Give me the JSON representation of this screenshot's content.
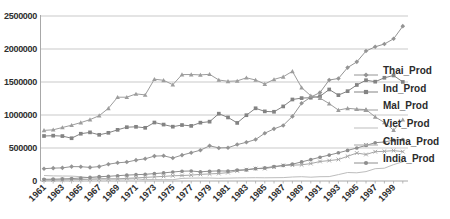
{
  "colors": {
    "background": "#ffffff",
    "gridline": "#c9c9c9",
    "axis": "#a8a8a8",
    "tick_text": "#2e2e2e",
    "legend_text": "#2b2b2b"
  },
  "chart_data": {
    "type": "line",
    "title": "",
    "xlabel": "",
    "ylabel": "",
    "grid": "horizontal",
    "legend_position": "right",
    "ylim": [
      0,
      2500000
    ],
    "y_ticks": [
      0,
      500000,
      1000000,
      1500000,
      2000000,
      2500000
    ],
    "y_tick_labels": [
      "0",
      "500000",
      "1000000",
      "1500000",
      "2000000",
      "2500000"
    ],
    "x": [
      1961,
      1962,
      1963,
      1964,
      1965,
      1966,
      1967,
      1968,
      1969,
      1970,
      1971,
      1972,
      1973,
      1974,
      1975,
      1976,
      1977,
      1978,
      1979,
      1980,
      1981,
      1982,
      1983,
      1984,
      1985,
      1986,
      1987,
      1988,
      1989,
      1990,
      1991,
      1992,
      1993,
      1994,
      1995,
      1996,
      1997,
      1998,
      1999,
      2000
    ],
    "x_tick_labels": [
      "1961",
      "1963",
      "1965",
      "1967",
      "1969",
      "1971",
      "1973",
      "1975",
      "1977",
      "1979",
      "1981",
      "1983",
      "1985",
      "1987",
      "1989",
      "1991",
      "1993",
      "1995",
      "1997",
      "1999"
    ],
    "series": [
      {
        "name": "Thai_Prod",
        "marker": "diamond",
        "color": "#949494",
        "values": [
          186000,
          195000,
          199000,
          218000,
          216000,
          206000,
          218000,
          254000,
          276000,
          287000,
          316000,
          336000,
          377000,
          382000,
          349000,
          392000,
          429000,
          467000,
          534000,
          501000,
          504000,
          552000,
          587000,
          629000,
          724000,
          790000,
          842000,
          979000,
          1178000,
          1271000,
          1341000,
          1531000,
          1553000,
          1718000,
          1805000,
          1970000,
          2033000,
          2076000,
          2155000,
          2346000
        ]
      },
      {
        "name": "Ind_Prod",
        "marker": "square",
        "color": "#838383",
        "values": [
          682000,
          687000,
          681000,
          648000,
          716000,
          737000,
          700000,
          730000,
          775000,
          815000,
          821000,
          806000,
          886000,
          855000,
          823000,
          848000,
          835000,
          884000,
          899000,
          1020000,
          963000,
          880000,
          997000,
          1102000,
          1055000,
          1049000,
          1130000,
          1235000,
          1256000,
          1262000,
          1284000,
          1387000,
          1301000,
          1361000,
          1455000,
          1527000,
          1505000,
          1564000,
          1599000,
          1501000
        ]
      },
      {
        "name": "Mal_Prod",
        "marker": "triangle",
        "color": "#9d9d9d",
        "values": [
          767000,
          776000,
          811000,
          845000,
          885000,
          930000,
          990000,
          1101000,
          1269000,
          1269000,
          1319000,
          1304000,
          1542000,
          1525000,
          1459000,
          1612000,
          1613000,
          1607000,
          1617000,
          1530000,
          1510000,
          1516000,
          1564000,
          1530000,
          1469000,
          1539000,
          1579000,
          1662000,
          1415000,
          1291000,
          1256000,
          1173000,
          1074000,
          1101000,
          1089000,
          1082000,
          971000,
          886000,
          769000,
          928000
        ]
      },
      {
        "name": "Viet_Prod",
        "marker": "none",
        "color": "#bdbdbd",
        "values": [
          83000,
          77000,
          76000,
          74000,
          65000,
          48000,
          43000,
          33000,
          30000,
          29000,
          33000,
          20000,
          21000,
          19000,
          20000,
          40000,
          44000,
          46000,
          45000,
          41000,
          44000,
          47000,
          49000,
          50000,
          48000,
          50000,
          52000,
          60000,
          65000,
          58000,
          65000,
          67000,
          97000,
          129000,
          125000,
          143000,
          187000,
          194000,
          249000,
          291000
        ]
      },
      {
        "name": "China_Prod",
        "marker": "x",
        "color": "#a6a6a6",
        "values": [
          14000,
          15000,
          17000,
          20000,
          23000,
          26000,
          29000,
          30000,
          32000,
          41000,
          47000,
          54000,
          62000,
          70000,
          79000,
          84000,
          89000,
          100000,
          107000,
          113000,
          127000,
          153000,
          172000,
          189000,
          188000,
          210000,
          237000,
          240000,
          245000,
          264000,
          296000,
          309000,
          326000,
          374000,
          424000,
          402000,
          444000,
          450000,
          460000,
          445000
        ]
      },
      {
        "name": "India_Prod",
        "marker": "circle",
        "color": "#8e8e8e",
        "values": [
          25000,
          28000,
          32000,
          37000,
          45000,
          54000,
          65000,
          71000,
          80000,
          89000,
          96000,
          102000,
          112000,
          122000,
          136000,
          148000,
          152000,
          140000,
          148000,
          153000,
          150000,
          166000,
          168000,
          187000,
          198000,
          219000,
          235000,
          255000,
          289000,
          324000,
          360000,
          393000,
          428000,
          464000,
          500000,
          540000,
          580000,
          591000,
          620000,
          629000
        ]
      }
    ]
  }
}
